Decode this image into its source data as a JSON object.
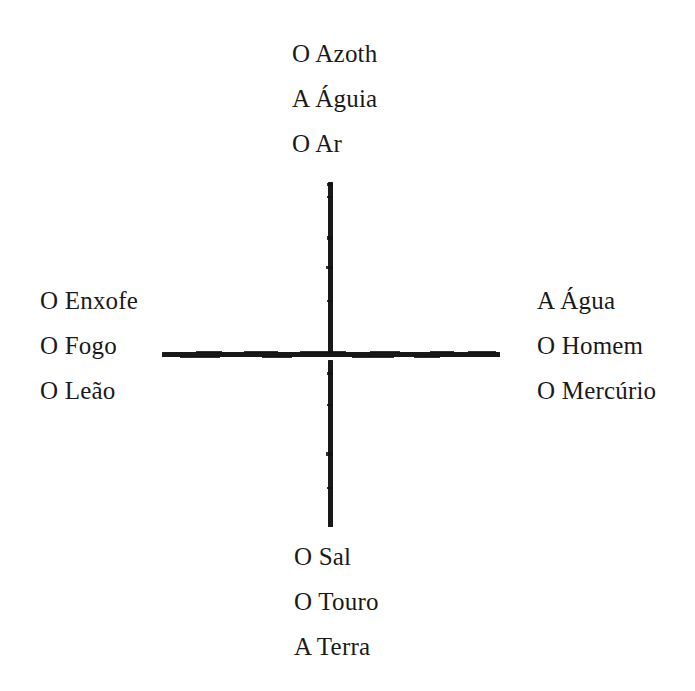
{
  "diagram": {
    "background_color": "#ffffff",
    "ink_color": "#1a1a1a",
    "type": "cross-diagram",
    "cross": {
      "center_x": 330,
      "center_y": 355,
      "vertical_top": 182,
      "vertical_bottom": 527,
      "horizontal_left": 162,
      "horizontal_right": 500,
      "stroke_width": 5,
      "has_gap_at_intersection": true
    },
    "groups": {
      "top": {
        "position": "top",
        "align": "left",
        "lines": [
          "O Azoth",
          "A Águia",
          "O Ar"
        ]
      },
      "left": {
        "position": "left",
        "align": "left",
        "lines": [
          "O Enxofe",
          "O Fogo",
          "O Leão"
        ]
      },
      "right": {
        "position": "right",
        "align": "left",
        "lines": [
          "A Água",
          "O Homem",
          "O Mercúrio"
        ]
      },
      "bottom": {
        "position": "bottom",
        "align": "left",
        "lines": [
          "O Sal",
          "O Touro",
          "A Terra"
        ]
      }
    }
  }
}
